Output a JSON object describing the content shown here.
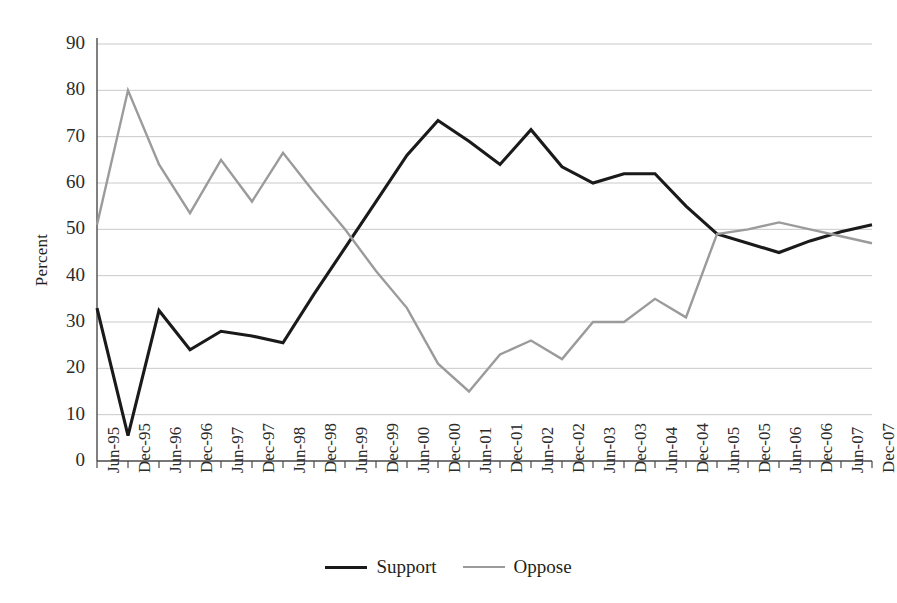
{
  "chart_data": {
    "type": "line",
    "title": "",
    "xlabel": "",
    "ylabel": "Percent",
    "ylim": [
      0,
      90
    ],
    "ytick_values": [
      0,
      10,
      20,
      30,
      40,
      50,
      60,
      70,
      80,
      90
    ],
    "grid": true,
    "legend_position": "bottom",
    "categories": [
      "Jun-95",
      "Dec-95",
      "Jun-96",
      "Dec-96",
      "Jun-97",
      "Dec-97",
      "Jun-98",
      "Dec-98",
      "Jun-99",
      "Dec-99",
      "Jun-00",
      "Dec-00",
      "Jun-01",
      "Dec-01",
      "Jun-02",
      "Dec-02",
      "Jun-03",
      "Dec-03",
      "Jun-04",
      "Dec-04",
      "Jun-05",
      "Dec-05",
      "Jun-06",
      "Dec-06",
      "Jun-07",
      "Dec-07"
    ],
    "series": [
      {
        "name": "Support",
        "color": "#1a1a1a",
        "values": [
          33,
          5.5,
          32.5,
          24,
          28,
          27,
          25.5,
          36,
          46,
          56,
          66,
          73.5,
          69,
          64,
          71.5,
          63.5,
          60,
          62,
          62,
          55,
          49,
          47,
          45,
          47.5,
          49.5,
          51
        ]
      },
      {
        "name": "Oppose",
        "color": "#9b9b9b",
        "values": [
          51,
          80,
          64,
          53.5,
          65,
          56,
          66.5,
          58,
          50,
          41,
          33,
          21,
          15,
          23,
          26,
          22,
          30,
          30,
          35,
          31,
          49,
          50,
          51.5,
          50,
          48.5,
          47
        ]
      }
    ],
    "legend": [
      {
        "label": "Support",
        "swatch": "support"
      },
      {
        "label": "Oppose",
        "swatch": "oppose"
      }
    ]
  },
  "axis": {
    "y_label_text": "Percent"
  }
}
